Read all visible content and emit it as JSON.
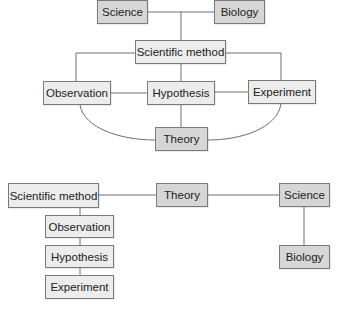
{
  "diagram_top": {
    "nodes": {
      "science": "Science",
      "biology": "Biology",
      "scientific_method": "Scientific method",
      "observation": "Observation",
      "hypothesis": "Hypothesis",
      "experiment": "Experiment",
      "theory": "Theory"
    },
    "edges": [
      [
        "Science",
        "Biology"
      ],
      [
        "Science-Biology link",
        "Scientific method"
      ],
      [
        "Scientific method",
        "Observation"
      ],
      [
        "Scientific method",
        "Hypothesis"
      ],
      [
        "Scientific method",
        "Experiment"
      ],
      [
        "Observation",
        "Hypothesis"
      ],
      [
        "Hypothesis",
        "Experiment"
      ],
      [
        "Hypothesis",
        "Theory"
      ],
      [
        "Observation",
        "Theory"
      ],
      [
        "Experiment",
        "Theory"
      ]
    ]
  },
  "diagram_bottom": {
    "nodes": {
      "scientific_method": "Scientific method",
      "observation": "Observation",
      "hypothesis": "Hypothesis",
      "experiment": "Experiment",
      "theory": "Theory",
      "science": "Science",
      "biology": "Biology"
    },
    "edges": [
      [
        "Scientific method",
        "Theory"
      ],
      [
        "Theory",
        "Science"
      ],
      [
        "Scientific method",
        "Observation"
      ],
      [
        "Observation",
        "Hypothesis"
      ],
      [
        "Hypothesis",
        "Experiment"
      ],
      [
        "Science",
        "Biology"
      ]
    ]
  },
  "colors": {
    "dark_node": "#d6d6d6",
    "light_node": "#ececec",
    "border": "#7a7a7a",
    "line": "#6e6e6e"
  }
}
